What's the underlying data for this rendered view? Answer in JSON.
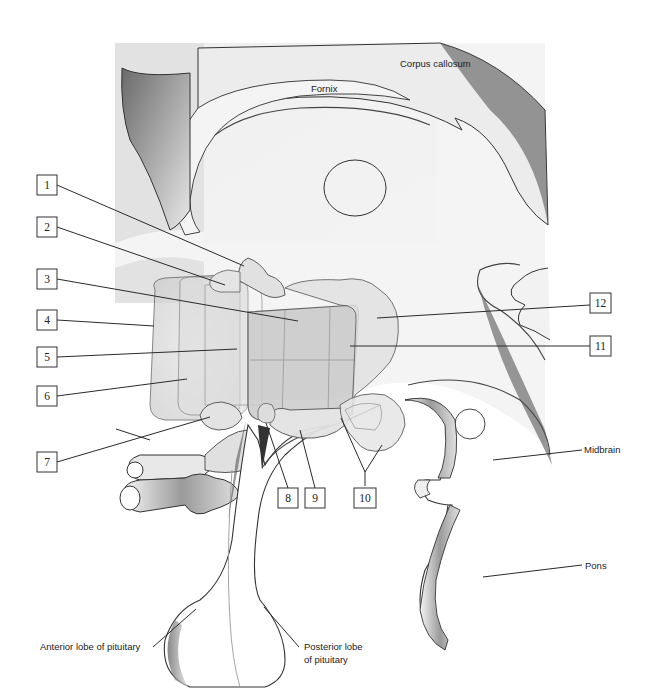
{
  "diagram": {
    "structure_labels": [
      {
        "id": "corpus-callosum",
        "text": "Corpus callosum"
      },
      {
        "id": "fornix",
        "text": "Fornix"
      },
      {
        "id": "midbrain",
        "text": "Midbrain"
      },
      {
        "id": "pons",
        "text": "Pons"
      },
      {
        "id": "anterior-pituitary",
        "text": "Anterior lobe of pituitary"
      },
      {
        "id": "posterior-pituitary-line1",
        "text": "Posterior lobe"
      },
      {
        "id": "posterior-pituitary-line2",
        "text": "of pituitary"
      }
    ],
    "numbered_callouts": [
      "1",
      "2",
      "3",
      "4",
      "5",
      "6",
      "7",
      "8",
      "9",
      "10",
      "11",
      "12"
    ],
    "colors": {
      "background_panel": "#e6e6e6",
      "nucleus_fill": "#d9d9d9",
      "outline": "#444444",
      "label_text": "#222222"
    }
  }
}
